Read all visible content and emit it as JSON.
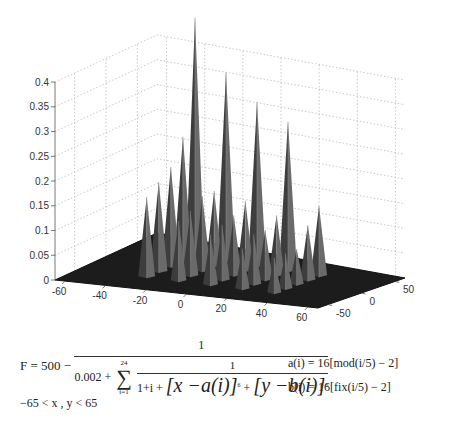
{
  "chart_data": {
    "type": "surface3d",
    "title": "",
    "xlabel": "",
    "ylabel": "",
    "zlabel": "",
    "x_ticks": [
      -60,
      -40,
      -20,
      0,
      20,
      40,
      60
    ],
    "y_ticks": [
      -50,
      0,
      50
    ],
    "z_ticks": [
      0,
      0.05,
      0.1,
      0.15,
      0.2,
      0.25,
      0.3,
      0.35,
      0.4
    ],
    "z_tick_labels": [
      "0",
      "0.05",
      "0.1",
      "0.15",
      "0.2",
      "0.25",
      "0.3",
      "0.35",
      "0.4"
    ],
    "xlim": [
      -65,
      65
    ],
    "ylim": [
      -65,
      65
    ],
    "zlim": [
      0,
      0.45
    ],
    "grid": true,
    "colormap": "gray",
    "peaks": [
      {
        "i": 0,
        "x": -32,
        "y": 32,
        "z": 0.48
      },
      {
        "i": 1,
        "x": -16,
        "y": 32,
        "z": 0.38
      },
      {
        "i": 2,
        "x": 0,
        "y": 32,
        "z": 0.33
      },
      {
        "i": 3,
        "x": 16,
        "y": 32,
        "z": 0.3
      },
      {
        "i": 4,
        "x": 32,
        "y": 32,
        "z": 0.14
      },
      {
        "i": 5,
        "x": -32,
        "y": 16,
        "z": 0.25
      },
      {
        "i": 6,
        "x": -16,
        "y": 16,
        "z": 0.15
      },
      {
        "i": 7,
        "x": 0,
        "y": 16,
        "z": 0.14
      },
      {
        "i": 8,
        "x": 16,
        "y": 16,
        "z": 0.12
      },
      {
        "i": 9,
        "x": 32,
        "y": 16,
        "z": 0.11
      },
      {
        "i": 10,
        "x": -32,
        "y": 0,
        "z": 0.2
      },
      {
        "i": 11,
        "x": -16,
        "y": 0,
        "z": 0.15
      },
      {
        "i": 12,
        "x": 0,
        "y": 0,
        "z": 0.12
      },
      {
        "i": 13,
        "x": 16,
        "y": 0,
        "z": 0.1
      },
      {
        "i": 14,
        "x": 32,
        "y": 0,
        "z": 0.07
      },
      {
        "i": 15,
        "x": -32,
        "y": -16,
        "z": 0.18
      },
      {
        "i": 16,
        "x": -16,
        "y": -16,
        "z": 0.13
      },
      {
        "i": 17,
        "x": 0,
        "y": -16,
        "z": 0.11
      },
      {
        "i": 18,
        "x": 16,
        "y": -16,
        "z": 0.1
      },
      {
        "i": 19,
        "x": 32,
        "y": -16,
        "z": 0.07
      },
      {
        "i": 20,
        "x": -32,
        "y": -32,
        "z": 0.16
      },
      {
        "i": 21,
        "x": -16,
        "y": -32,
        "z": 0.12
      },
      {
        "i": 22,
        "x": 0,
        "y": -32,
        "z": 0.1
      },
      {
        "i": 23,
        "x": 16,
        "y": -32,
        "z": 0.08
      },
      {
        "i": 24,
        "x": 32,
        "y": -32,
        "z": 0.07
      }
    ]
  },
  "formula": {
    "lhs": "F = 500 −",
    "numerator": "1",
    "den_const": "0.002 +",
    "sum_upper": "24",
    "sum_lower": "i=1",
    "inner_num": "1",
    "inner_den_a": "1+i +",
    "inner_den_b": "[x −a(i)]",
    "inner_den_c": " +",
    "inner_den_d": "[y −b(i)]",
    "exp": "6",
    "a_def": "a(i) = 16[mod(i/5) − 2]",
    "b_def": "b(i) = 16[fix(i/5) − 2]",
    "range": "−65 < x , y  < 65"
  }
}
